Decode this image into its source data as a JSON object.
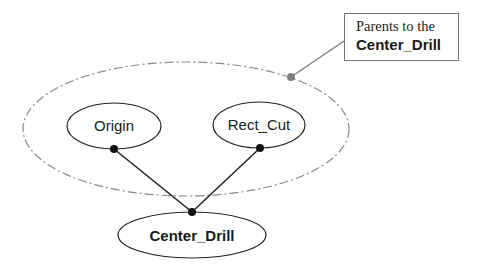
{
  "diagram": {
    "type": "parent-child dependency graph",
    "nodes": [
      {
        "id": "origin",
        "label": "Origin",
        "role": "parent"
      },
      {
        "id": "rect_cut",
        "label": "Rect_Cut",
        "role": "parent"
      },
      {
        "id": "center_drill",
        "label": "Center_Drill",
        "role": "child"
      }
    ],
    "edges": [
      {
        "from": "origin",
        "to": "center_drill"
      },
      {
        "from": "rect_cut",
        "to": "center_drill"
      }
    ],
    "group": {
      "label": "Parents to the Center_Drill",
      "members": [
        "origin",
        "rect_cut"
      ]
    },
    "callout": {
      "line1": "Parents to the",
      "line2": "Center_Drill"
    },
    "colors": {
      "node_stroke": "#222222",
      "group_stroke": "#888888",
      "callout_leader": "#777777",
      "connector_dot": "#111111",
      "callout_dot": "#808080"
    }
  }
}
